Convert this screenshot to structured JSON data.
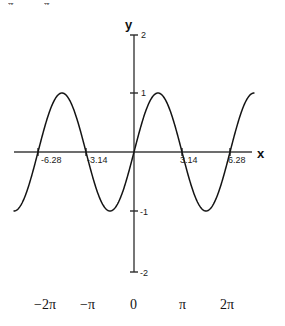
{
  "figure": {
    "name": "sine-wave-plot",
    "axis_labels": {
      "x": "x",
      "y": "y"
    },
    "x_tick_labels": [
      "-6.28",
      "-3.14",
      "3.14",
      "6.28"
    ],
    "y_tick_labels": [
      "2",
      "1",
      "-1",
      "-2"
    ],
    "pi_row_labels": [
      "−2π",
      "−π",
      "0",
      "π",
      "2π"
    ],
    "top_artifacts": [
      "π",
      "π"
    ],
    "colors": {
      "curve": "#141414",
      "axis": "#3c3c3c",
      "background": "#ffffff",
      "text": "#1a1a1a"
    }
  },
  "chart_data": {
    "type": "line",
    "title": "",
    "xlabel": "x",
    "ylabel": "y",
    "grid": false,
    "legend": false,
    "function": "y = sin(x)",
    "xlim": [
      -7.85,
      7.85
    ],
    "ylim": [
      -2,
      2
    ],
    "xticks": [
      -6.28,
      -3.14,
      0,
      3.14,
      6.28
    ],
    "xtick_labels": [
      "-6.28",
      "-3.14",
      "0",
      "3.14",
      "6.28"
    ],
    "yticks": [
      -2,
      -1,
      0,
      1,
      2
    ],
    "ytick_labels": [
      "-2",
      "-1",
      "0",
      "1",
      "2"
    ],
    "secondary_xtick_labels": [
      "−2π",
      "−π",
      "0",
      "π",
      "2π"
    ],
    "series": [
      {
        "name": "sin(x)",
        "x": [
          -7.6,
          -7.2,
          -6.8,
          -6.4,
          -6.0,
          -5.6,
          -5.2,
          -4.8,
          -4.4,
          -4.0,
          -3.6,
          -3.2,
          -2.8,
          -2.4,
          -2.0,
          -1.6,
          -1.2,
          -0.8,
          -0.4,
          0.0,
          0.4,
          0.8,
          1.2,
          1.6,
          2.0,
          2.4,
          2.8,
          3.2,
          3.6,
          4.0,
          4.4,
          4.8,
          5.2,
          5.6,
          6.0,
          6.4,
          6.8,
          7.2,
          7.6
        ],
        "values": [
          -0.97,
          -0.79,
          -0.49,
          -0.12,
          0.28,
          0.63,
          0.88,
          0.996,
          0.95,
          0.76,
          0.44,
          0.06,
          -0.33,
          -0.68,
          -0.91,
          -1.0,
          -0.93,
          -0.72,
          -0.39,
          0.0,
          0.39,
          0.72,
          0.93,
          1.0,
          0.91,
          0.68,
          0.33,
          -0.06,
          -0.44,
          -0.76,
          -0.95,
          -0.996,
          -0.88,
          -0.63,
          -0.28,
          0.12,
          0.49,
          0.79,
          0.97
        ]
      }
    ]
  }
}
